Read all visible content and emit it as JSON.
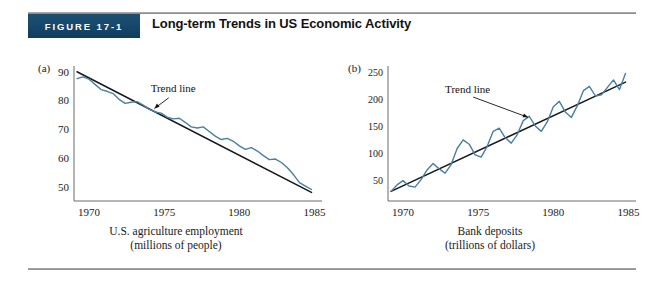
{
  "header": {
    "badge_label": "Figure 17-1",
    "title": "Long-term Trends in US Economic Activity"
  },
  "colors": {
    "badge_background": "#17496c",
    "series_line": "#4a7fa0",
    "trend_line": "#15181c",
    "axis": "#6b6b6b",
    "text": "#1a1a1a",
    "page_background": "#ffffff",
    "rule": "#8a8a8a"
  },
  "panels": [
    {
      "letter": "(a)",
      "caption_line1": "U.S. agriculture employment",
      "caption_line2": "(millions of people)"
    },
    {
      "letter": "(b)",
      "caption_line1": "Bank deposits",
      "caption_line2": "(trillions of dollars)"
    }
  ],
  "chart_data": [
    {
      "type": "line",
      "panel": "(a)",
      "title": "U.S. agriculture employment (millions of people)",
      "xlabel": "",
      "ylabel": "millions of people",
      "xlim": [
        1969,
        1985.5
      ],
      "ylim": [
        45,
        92
      ],
      "xticks": [
        1970,
        1975,
        1980,
        1985
      ],
      "xtick_labels": [
        "1970",
        "1975",
        "1980",
        "1985"
      ],
      "yticks": [
        50,
        60,
        70,
        80,
        90
      ],
      "ytick_labels": [
        "50",
        "60",
        "70",
        "80",
        "90"
      ],
      "grid": false,
      "legend": "none",
      "annotations": [
        {
          "text": "Trend line",
          "x": 1975.6,
          "y": 83.0,
          "arrow_to_x": 1974.2,
          "arrow_to_y": 76.5
        }
      ],
      "series": [
        {
          "name": "Trend line",
          "type": "trend",
          "color": "#15181c",
          "x": [
            1969.2,
            1984.8
          ],
          "values": [
            90.0,
            48.0
          ]
        },
        {
          "name": "U.S. agriculture employment",
          "type": "observed",
          "color": "#4a7fa0",
          "x": [
            1969.2,
            1969.6,
            1970.0,
            1970.4,
            1970.8,
            1971.2,
            1971.6,
            1972.0,
            1972.4,
            1972.8,
            1973.2,
            1973.6,
            1974.0,
            1974.4,
            1974.8,
            1975.2,
            1975.6,
            1976.0,
            1976.4,
            1976.8,
            1977.2,
            1977.6,
            1978.0,
            1978.4,
            1978.8,
            1979.2,
            1979.6,
            1980.0,
            1980.4,
            1980.8,
            1981.2,
            1981.6,
            1982.0,
            1982.4,
            1982.8,
            1983.2,
            1983.6,
            1984.0,
            1984.4,
            1984.8
          ],
          "values": [
            87.6,
            88.2,
            87.4,
            85.6,
            83.8,
            83.2,
            82.4,
            80.4,
            79.0,
            79.4,
            79.6,
            78.4,
            77.0,
            76.0,
            75.6,
            74.2,
            73.6,
            73.8,
            72.4,
            70.8,
            70.4,
            70.8,
            69.2,
            67.6,
            66.4,
            66.8,
            65.8,
            64.2,
            63.0,
            63.6,
            62.4,
            60.8,
            59.4,
            59.6,
            58.4,
            56.6,
            54.2,
            51.4,
            50.2,
            49.0
          ]
        }
      ]
    },
    {
      "type": "line",
      "panel": "(b)",
      "title": "Bank deposits (trillions of dollars)",
      "xlabel": "",
      "ylabel": "trillions of dollars",
      "xlim": [
        1969,
        1985.5
      ],
      "ylim": [
        10,
        262
      ],
      "xticks": [
        1970,
        1975,
        1980,
        1985
      ],
      "xtick_labels": [
        "1970",
        "1975",
        "1980",
        "1985"
      ],
      "yticks": [
        50,
        100,
        150,
        200,
        250
      ],
      "ytick_labels": [
        "50",
        "100",
        "150",
        "200",
        "250"
      ],
      "grid": false,
      "legend": "none",
      "annotations": [
        {
          "text": "Trend line",
          "x": 1974.3,
          "y": 212.0,
          "arrow_to_x": 1978.5,
          "arrow_to_y": 164.0
        }
      ],
      "series": [
        {
          "name": "Trend line",
          "type": "trend",
          "color": "#15181c",
          "x": [
            1969.2,
            1984.8
          ],
          "values": [
            28.0,
            232.0
          ]
        },
        {
          "name": "Bank deposits",
          "type": "observed",
          "color": "#4a7fa0",
          "x": [
            1969.2,
            1969.6,
            1970.0,
            1970.4,
            1970.8,
            1971.2,
            1971.6,
            1972.0,
            1972.4,
            1972.8,
            1973.2,
            1973.6,
            1974.0,
            1974.4,
            1974.8,
            1975.2,
            1975.6,
            1976.0,
            1976.4,
            1976.8,
            1977.2,
            1977.6,
            1978.0,
            1978.4,
            1978.8,
            1979.2,
            1979.6,
            1980.0,
            1980.4,
            1980.8,
            1981.2,
            1981.6,
            1982.0,
            1982.4,
            1982.8,
            1983.2,
            1983.6,
            1984.0,
            1984.4,
            1984.8
          ],
          "values": [
            28.0,
            40.0,
            48.0,
            38.0,
            36.0,
            50.0,
            68.0,
            80.0,
            70.0,
            62.0,
            78.0,
            108.0,
            124.0,
            116.0,
            96.0,
            92.0,
            112.0,
            140.0,
            146.0,
            128.0,
            118.0,
            134.0,
            160.0,
            168.0,
            150.0,
            140.0,
            158.0,
            186.0,
            196.0,
            176.0,
            166.0,
            188.0,
            216.0,
            224.0,
            206.0,
            208.0,
            222.0,
            236.0,
            218.0,
            248.0
          ]
        }
      ]
    }
  ]
}
